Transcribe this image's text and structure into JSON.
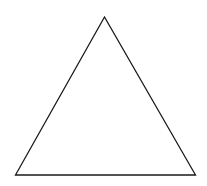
{
  "diagram": {
    "type": "shape",
    "shape": "triangle",
    "width": 207,
    "height": 186,
    "background": "#ffffff",
    "stroke_color": "#1a1a1a",
    "stroke_width": 1.3,
    "fill": "none",
    "points": "104.5,17 15.5,175 195.5,175"
  }
}
